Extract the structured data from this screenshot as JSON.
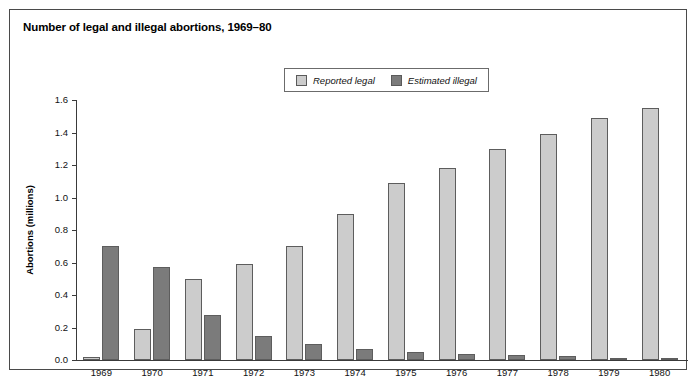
{
  "figure": {
    "title": "Number of legal and illegal abortions, 1969–80"
  },
  "legend": {
    "entries": [
      {
        "label": "Reported legal",
        "color": "#cccccc",
        "name": "legend-reported-legal"
      },
      {
        "label": "Estimated illegal",
        "color": "#7b7b7b",
        "name": "legend-estimated-illegal"
      }
    ]
  },
  "colors": {
    "legal": "#cccccc",
    "illegal": "#7b7b7b",
    "bar_outline": "#5d5d5d",
    "axis": "#3a3a3a",
    "frame": "#4a4a4a",
    "text": "#111111",
    "background": "#ffffff"
  },
  "chart_data": {
    "type": "bar",
    "title": "Number of legal and illegal abortions, 1969–80",
    "xlabel": "",
    "ylabel": "Abortions (millions)",
    "ylim": [
      0.0,
      1.6
    ],
    "ytick_labels": [
      "0.0",
      "0.2",
      "0.4",
      "0.6",
      "0.8",
      "1.0",
      "1.2",
      "1.4",
      "1.6"
    ],
    "ytick_values": [
      0.0,
      0.2,
      0.4,
      0.6,
      0.8,
      1.0,
      1.2,
      1.4,
      1.6
    ],
    "grid": false,
    "legend_position": "top-center",
    "categories": [
      "1969",
      "1970",
      "1971",
      "1972",
      "1973",
      "1974",
      "1975",
      "1976",
      "1977",
      "1978",
      "1979",
      "1980"
    ],
    "series": [
      {
        "name": "Reported legal",
        "color": "#cccccc",
        "values": [
          0.02,
          0.19,
          0.5,
          0.59,
          0.7,
          0.9,
          1.09,
          1.18,
          1.3,
          1.39,
          1.49,
          1.55
        ]
      },
      {
        "name": "Estimated illegal",
        "color": "#7b7b7b",
        "values": [
          0.7,
          0.57,
          0.28,
          0.15,
          0.1,
          0.065,
          0.05,
          0.035,
          0.03,
          0.025,
          0.015,
          0.01
        ]
      }
    ]
  }
}
